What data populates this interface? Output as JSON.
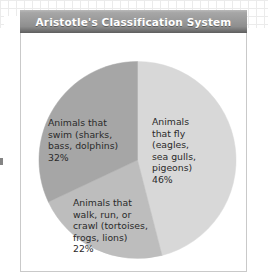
{
  "figure": {
    "title": "Aristotle's Classification System"
  },
  "colors": {
    "title_bar_light": "#b9b9b9",
    "title_bar_dark": "#5e5e5e",
    "title_text": "#ffffff",
    "frame_border": "#c9c9c9",
    "label_text": "#2a2a2a",
    "slice_fly": "#d8d8d8",
    "slice_walk": "#bdbdbd",
    "slice_swim": "#a6a6a6",
    "page_background": "#ffffff",
    "grid_line": "#dcdcdc"
  },
  "chart_data": {
    "type": "pie",
    "title": "Aristotle's Classification System",
    "xlabel": "",
    "ylabel": "",
    "legend_position": "none",
    "grid": false,
    "start_angle_deg": 0,
    "direction": "clockwise",
    "categories": [
      "Animals that fly (eagles, sea gulls, pigeons)",
      "Animals that walk, run, or crawl (tortoises, frogs, lions)",
      "Animals that swim (sharks, bass, dolphins)"
    ],
    "values": [
      46,
      22,
      32
    ],
    "unit": "%",
    "slices": [
      {
        "name": "fly",
        "label": "Animals\nthat fly\n(eagles,\nsea gulls,\npigeons)\n46%",
        "percent_text": "46%",
        "value": 46,
        "color": "#d8d8d8"
      },
      {
        "name": "walk",
        "label": "Animals that\nwalk, run, or\ncrawl (tortoises,\nfrogs, lions)\n22%",
        "percent_text": "22%",
        "value": 22,
        "color": "#bdbdbd"
      },
      {
        "name": "swim",
        "label": "Animals that\nswim (sharks,\nbass, dolphins)\n32%",
        "percent_text": "32%",
        "value": 32,
        "color": "#a6a6a6"
      }
    ]
  }
}
